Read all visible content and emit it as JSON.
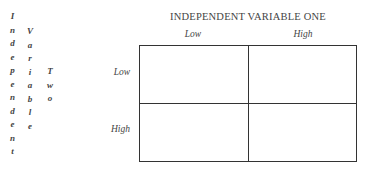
{
  "row_axis": {
    "label_words": [
      "Independent",
      "Variable",
      "Two"
    ],
    "letters_col1": [
      "I",
      "n",
      "d",
      "e",
      "p",
      "e",
      "n",
      "d",
      "e",
      "n",
      "t"
    ],
    "letters_col2": [
      "V",
      "a",
      "r",
      "i",
      "a",
      "b",
      "l",
      "e"
    ],
    "letters_col3": [
      "T",
      "w",
      "o"
    ]
  },
  "column_axis": {
    "title": "INDEPENDENT VARIABLE ONE",
    "levels": [
      "Low",
      "High"
    ]
  },
  "row_levels": [
    "Low",
    "High"
  ],
  "cells": [
    [
      "",
      ""
    ],
    [
      "",
      ""
    ]
  ]
}
